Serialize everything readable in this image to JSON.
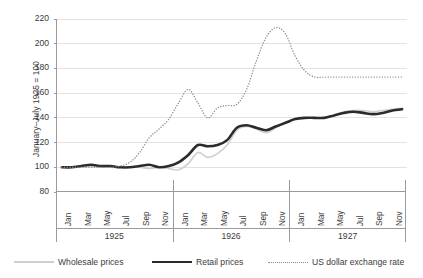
{
  "chart_data": {
    "type": "line",
    "title": "",
    "xlabel": "",
    "ylabel": "January–July 1925 = 100",
    "ylim": [
      80,
      220
    ],
    "yticks": [
      80,
      100,
      120,
      140,
      160,
      180,
      200,
      220
    ],
    "grid": true,
    "legend_position": "bottom",
    "year_groups": [
      "1925",
      "1926",
      "1927"
    ],
    "months_per_group": 12,
    "x": [
      "Jan 1925",
      "Feb 1925",
      "Mar 1925",
      "Apr 1925",
      "May 1925",
      "Jun 1925",
      "Jul 1925",
      "Aug 1925",
      "Sep 1925",
      "Oct 1925",
      "Nov 1925",
      "Dec 1925",
      "Jan 1926",
      "Feb 1926",
      "Mar 1926",
      "Apr 1926",
      "May 1926",
      "Jun 1926",
      "Jul 1926",
      "Aug 1926",
      "Sep 1926",
      "Oct 1926",
      "Nov 1926",
      "Dec 1926",
      "Jan 1927",
      "Feb 1927",
      "Mar 1927",
      "Apr 1927",
      "May 1927",
      "Jun 1927",
      "Jul 1927",
      "Aug 1927",
      "Sep 1927",
      "Oct 1927",
      "Nov 1927",
      "Dec 1927"
    ],
    "xtick_labels": [
      "Jan",
      "Mar",
      "May",
      "Jul",
      "Sep",
      "Nov",
      "Jan",
      "Mar",
      "May",
      "Jul",
      "Sep",
      "Nov",
      "Jan",
      "Mar",
      "May",
      "Jul",
      "Sep",
      "Nov"
    ],
    "xtick_indices": [
      0,
      2,
      4,
      6,
      8,
      10,
      12,
      14,
      16,
      18,
      20,
      22,
      24,
      26,
      28,
      30,
      32,
      34
    ],
    "series": [
      {
        "name": "Wholesale prices",
        "color": "#cfcfcf",
        "style": "solid",
        "width": 1.6,
        "values": [
          100,
          100,
          101,
          101,
          101,
          100,
          100,
          100,
          100,
          99,
          100,
          99,
          98,
          103,
          112,
          108,
          111,
          118,
          130,
          133,
          131,
          128,
          132,
          136,
          139,
          140,
          140,
          140,
          142,
          145,
          146,
          146,
          145,
          146,
          147,
          148
        ]
      },
      {
        "name": "Retail prices",
        "color": "#2b2b2b",
        "style": "solid",
        "width": 2.6,
        "values": [
          100,
          100,
          101,
          102,
          101,
          101,
          100,
          100,
          101,
          102,
          100,
          101,
          104,
          110,
          118,
          117,
          118,
          122,
          132,
          134,
          132,
          130,
          133,
          136,
          139,
          140,
          140,
          140,
          142,
          144,
          145,
          144,
          143,
          144,
          146,
          147
        ]
      },
      {
        "name": "US dollar exchange rate",
        "color": "#8c8c8c",
        "style": "dotted",
        "width": 1.4,
        "values": [
          100,
          100,
          100,
          100,
          100,
          100,
          101,
          104,
          112,
          124,
          131,
          139,
          152,
          163,
          152,
          140,
          148,
          150,
          151,
          163,
          186,
          205,
          213,
          208,
          190,
          178,
          173,
          173,
          173,
          173,
          173,
          173,
          173,
          173,
          173,
          173
        ]
      }
    ]
  },
  "legend": {
    "items": [
      {
        "label": "Wholesale prices",
        "icon": "line-swatch-solid-gray"
      },
      {
        "label": "Retail prices",
        "icon": "line-swatch-solid-black"
      },
      {
        "label": "US dollar exchange rate",
        "icon": "line-swatch-dotted"
      }
    ]
  }
}
